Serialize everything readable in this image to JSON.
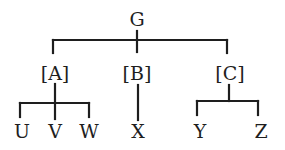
{
  "diagram": {
    "type": "tree",
    "root": {
      "label": "G",
      "children": [
        {
          "label": "[A]",
          "children": [
            {
              "label": "U"
            },
            {
              "label": "V"
            },
            {
              "label": "W"
            }
          ]
        },
        {
          "label": "[B]",
          "children": [
            {
              "label": "X"
            }
          ]
        },
        {
          "label": "[C]",
          "children": [
            {
              "label": "Y"
            },
            {
              "label": "Z"
            }
          ]
        }
      ]
    },
    "colors": {
      "line": "#1e1e1e",
      "text": "#1e1e1e",
      "background": "#ffffff"
    }
  }
}
